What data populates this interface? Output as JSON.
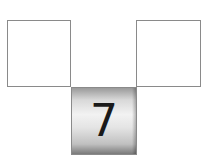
{
  "diagram": {
    "boxes": [
      {
        "id": "left",
        "value": ""
      },
      {
        "id": "right",
        "value": ""
      }
    ],
    "tile": {
      "value": "7"
    },
    "colors": {
      "border": "#8a8a8a",
      "digit": "#1a1a1a"
    }
  }
}
